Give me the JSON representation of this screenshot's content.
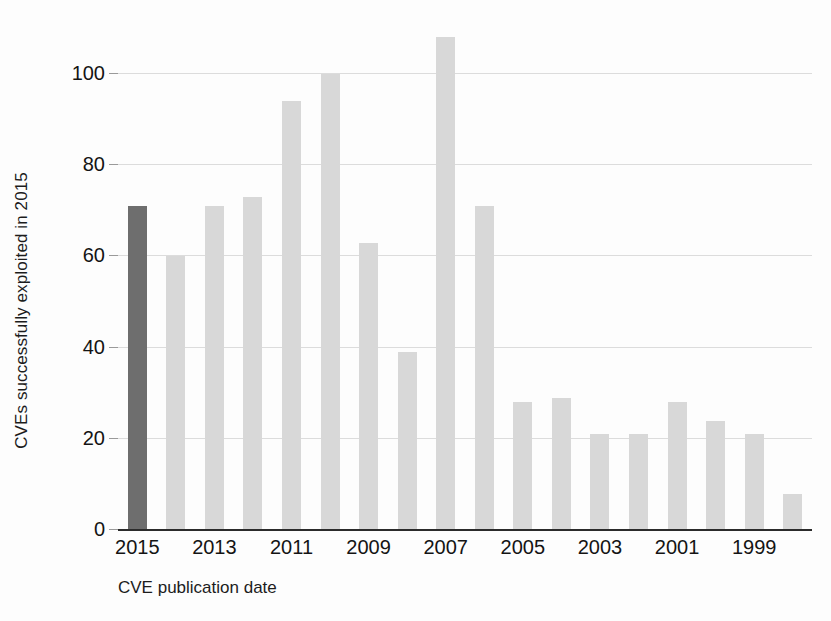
{
  "chart_data": {
    "type": "bar",
    "title": "",
    "subtitle": "",
    "xlabel": "CVE publication date",
    "ylabel": "CVEs successfully exploited in 2015",
    "categories": [
      "2015",
      "2014",
      "2013",
      "2012",
      "2011",
      "2010",
      "2009",
      "2008",
      "2007",
      "2006",
      "2005",
      "2004",
      "2003",
      "2002",
      "2001",
      "2000",
      "1999",
      "1998"
    ],
    "values": [
      71,
      60,
      71,
      73,
      94,
      100,
      63,
      39,
      108,
      71,
      28,
      29,
      21,
      21,
      28,
      24,
      21,
      8
    ],
    "highlight_index": 0,
    "highlight_category": "2015",
    "ylim": [
      0,
      112
    ],
    "yticks": [
      0,
      20,
      40,
      60,
      80,
      100
    ],
    "ytick_labels": [
      "0",
      "20",
      "40",
      "60",
      "80",
      "100"
    ],
    "xtick_labels": [
      "2015",
      "2013",
      "2011",
      "2009",
      "2007",
      "2005",
      "2003",
      "2001",
      "1999"
    ],
    "xtick_indices": [
      0,
      2,
      4,
      6,
      8,
      10,
      12,
      14,
      16
    ],
    "grid": true,
    "grid_axis": "y",
    "legend": "none",
    "bar_color": "#d8d8d8",
    "highlight_color": "#6e6e6e",
    "grid_color": "#dcdcdc",
    "axis_color": "#2b2b2b",
    "background_color": "#fdfdfd"
  }
}
